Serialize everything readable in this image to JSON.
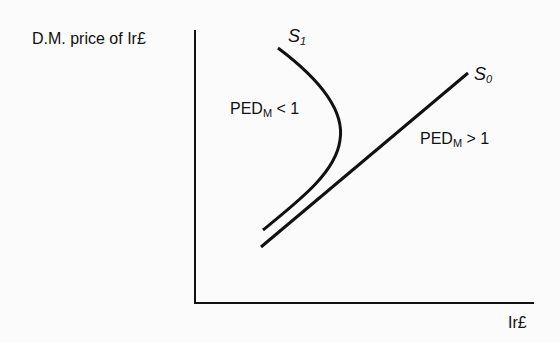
{
  "axes": {
    "y_label": "D.M. price of Ir£",
    "x_label": "Ir£"
  },
  "curves": [
    {
      "name": "S",
      "subscript": "1",
      "label": "PED",
      "label_sub": "M",
      "label_rel": "< 1"
    },
    {
      "name": "S",
      "subscript": "0",
      "label": "PED",
      "label_sub": "M",
      "label_rel": "> 1"
    }
  ],
  "colors": {
    "line": "#111111",
    "background": "#fbfbfb"
  }
}
